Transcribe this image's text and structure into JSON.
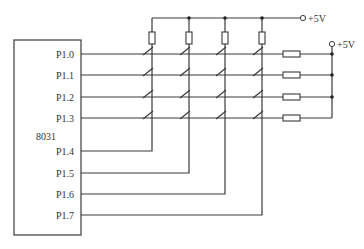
{
  "diagram": {
    "type": "keypad matrix circuit",
    "chip": {
      "label": "8031"
    },
    "pins": [
      "P1.0",
      "P1.1",
      "P1.2",
      "P1.3",
      "P1.4",
      "P1.5",
      "P1.6",
      "P1.7"
    ],
    "supply_top": "+5V",
    "supply_right": "+5V",
    "rows": 4,
    "columns": 4,
    "switches": 16,
    "pullup_resistors_columns": 4,
    "pullup_resistors_rows": 4
  }
}
